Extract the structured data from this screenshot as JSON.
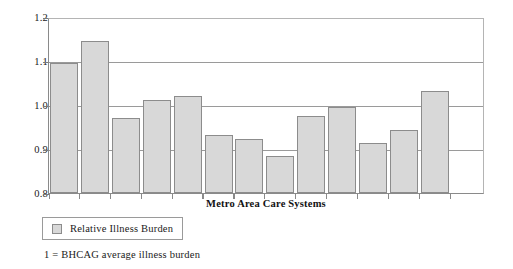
{
  "chart_data": {
    "type": "bar",
    "title": "",
    "xlabel": "Metro Area Care Systems",
    "ylabel": "",
    "categories": [
      "1",
      "2",
      "3",
      "4",
      "5",
      "6",
      "7",
      "8",
      "9",
      "10",
      "11",
      "12",
      "13"
    ],
    "values": [
      1.1,
      1.15,
      0.973,
      1.014,
      1.023,
      0.933,
      0.925,
      0.886,
      0.976,
      0.997,
      0.916,
      0.945,
      1.035
    ],
    "series": [
      {
        "name": "Relative Illness Burden",
        "values": [
          1.1,
          1.15,
          0.973,
          1.014,
          1.023,
          0.933,
          0.925,
          0.886,
          0.976,
          0.997,
          0.916,
          0.945,
          1.035
        ]
      }
    ],
    "ylim": [
      0.8,
      1.2
    ],
    "ytick_labels": [
      "1.2",
      "1.1",
      "1.0",
      "0.9",
      "0.8"
    ],
    "ytick_values": [
      1.2,
      1.1,
      1.0,
      0.9,
      0.8
    ],
    "xtick_labels": [],
    "grid": "horizontal",
    "legend_position": "below-left",
    "legend_entries": [
      "Relative Illness Burden"
    ],
    "annotations": [
      "1 = BHCAG average illness burden"
    ],
    "bar_fill_color": "#d8d8d8",
    "bar_edge_color": "#8c8c8c",
    "gridline_color": "#9a9a9a",
    "background_color": "#ffffff"
  },
  "axis": {
    "x_title": "Metro Area Care Systems",
    "y_ticks": [
      {
        "label": "1.2",
        "value": 1.2
      },
      {
        "label": "1.1",
        "value": 1.1
      },
      {
        "label": "1.0",
        "value": 1.0
      },
      {
        "label": "0.9",
        "value": 0.9
      },
      {
        "label": "0.8",
        "value": 0.8
      }
    ]
  },
  "legend": {
    "swatch_name": "bar-color-swatch",
    "label": "Relative Illness Burden"
  },
  "footnote": {
    "text": "1 = BHCAG average illness burden"
  }
}
